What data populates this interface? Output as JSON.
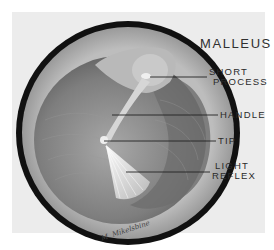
{
  "figure": {
    "title": "MALLEUS",
    "labels": [
      {
        "id": "short-process",
        "lines": [
          "SHORT",
          "PROCESS"
        ]
      },
      {
        "id": "handle",
        "lines": [
          "HANDLE"
        ]
      },
      {
        "id": "tip",
        "lines": [
          "TIP"
        ]
      },
      {
        "id": "light-reflex",
        "lines": [
          "LIGHT",
          "REFLEX"
        ]
      }
    ],
    "signature": "M. Mikelsbine",
    "colors": {
      "background": "#ececec",
      "ring": "#111111",
      "membrane": "#8a8a8a",
      "highlight": "#f2f2f2"
    }
  }
}
